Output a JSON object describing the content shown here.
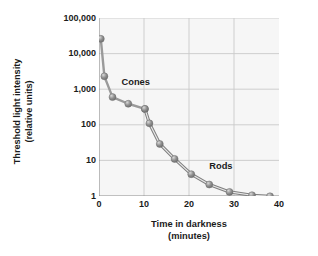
{
  "chart_data": {
    "type": "line",
    "title": "",
    "xlabel": "Time in darkness",
    "xlabel_sub": "(minutes)",
    "ylabel": "Threshold light intensity",
    "ylabel_sub": "(relative units)",
    "xlim": [
      0,
      40
    ],
    "ylim": [
      1,
      100000
    ],
    "yscale": "log",
    "grid": true,
    "legend_position": "inline-annotation",
    "xticks": [
      {
        "value": 0,
        "label": "0"
      },
      {
        "value": 10,
        "label": "10"
      },
      {
        "value": 20,
        "label": "20"
      },
      {
        "value": 30,
        "label": "30"
      },
      {
        "value": 40,
        "label": "40"
      }
    ],
    "yticks": [
      {
        "value": 100000,
        "label": "100,000"
      },
      {
        "value": 10000,
        "label": "10,000"
      },
      {
        "value": 1000,
        "label": "1,000"
      },
      {
        "value": 100,
        "label": "100"
      },
      {
        "value": 10,
        "label": "10"
      },
      {
        "value": 1,
        "label": "1"
      }
    ],
    "series": [
      {
        "name": "Cones",
        "annotation": "Cones",
        "annotation_x": 5.0,
        "annotation_y": 1600,
        "x": [
          0.4,
          1.2,
          3.0,
          6.5,
          10.2
        ],
        "y": [
          26000,
          2300,
          600,
          390,
          280
        ]
      },
      {
        "name": "Rods",
        "annotation": "Rods",
        "annotation_x": 24.5,
        "annotation_y": 7.0,
        "x": [
          10.2,
          11.2,
          13.5,
          16.8,
          20.5,
          24.5,
          29.0,
          34.0,
          38.0
        ],
        "y": [
          280,
          110,
          29,
          11,
          4.1,
          2.1,
          1.3,
          1.05,
          0.98
        ]
      }
    ],
    "colors": {
      "line": "#9a9a9a",
      "marker_fill": "#8e8e8e",
      "marker_highlight": "#d8d8d8",
      "grid": "#c9c9c9",
      "axis": "#8a8a8a",
      "plot_background": "#f6f6f6",
      "text": "#1b1b1b"
    }
  }
}
